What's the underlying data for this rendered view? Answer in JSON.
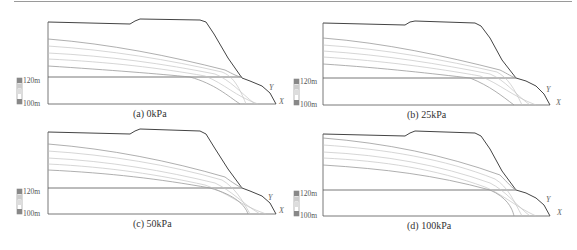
{
  "figure": {
    "panels": [
      {
        "id": "a",
        "caption": "(a) 0kPa",
        "scale_top": "120m",
        "scale_bottom": "100m",
        "label_y": "Y",
        "label_x": "X"
      },
      {
        "id": "b",
        "caption": "(b) 25kPa",
        "scale_top": "120m",
        "scale_bottom": "100m",
        "label_y": "Y",
        "label_x": "X"
      },
      {
        "id": "c",
        "caption": "(c) 50kPa",
        "scale_top": "120m",
        "scale_bottom": "100m",
        "label_y": "Y",
        "label_x": "X"
      },
      {
        "id": "d",
        "caption": "(d) 100kPa",
        "scale_top": "120m",
        "scale_bottom": "100m",
        "label_y": "Y",
        "label_x": "X"
      }
    ],
    "colors": {
      "outline": "#444444",
      "water_lines": "#b8b8b8",
      "phreatic_line": "#8c8c8c",
      "scale_dark": "#888888",
      "scale_light": "#d0d0d0"
    }
  }
}
